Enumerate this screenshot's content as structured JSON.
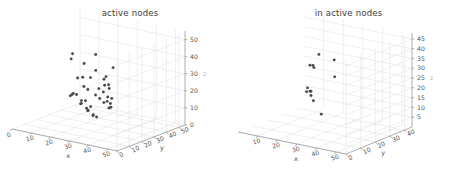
{
  "figure": {
    "background_color": "#ffffff",
    "point_color": "#4a4a4a",
    "grid_color": "#dcdcdc",
    "axis_color": "#8e8e8e"
  },
  "chart_data": [
    {
      "type": "scatter",
      "title": "active nodes",
      "xlabel": "x",
      "ylabel": "y",
      "zlabel": "z",
      "xlim": [
        0,
        55
      ],
      "ylim": [
        0,
        55
      ],
      "zlim": [
        0,
        55
      ],
      "xticks": [
        0,
        10,
        20,
        30,
        40,
        50
      ],
      "yticks": [
        0,
        10,
        20,
        30,
        40,
        50
      ],
      "zticks": [
        0,
        10,
        20,
        30,
        40,
        50
      ],
      "grid": true,
      "legend": "none",
      "points": [
        {
          "x": 38,
          "y": 9,
          "z": 50
        },
        {
          "x": 51,
          "y": 3,
          "z": 47
        },
        {
          "x": 22,
          "y": 15,
          "z": 45
        },
        {
          "x": 30,
          "y": 12,
          "z": 42
        },
        {
          "x": 40,
          "y": 6,
          "z": 42
        },
        {
          "x": 46,
          "y": 5,
          "z": 40
        },
        {
          "x": 20,
          "y": 17,
          "z": 41
        },
        {
          "x": 43,
          "y": 8,
          "z": 37
        },
        {
          "x": 48,
          "y": 4,
          "z": 36
        },
        {
          "x": 34,
          "y": 11,
          "z": 35
        },
        {
          "x": 44,
          "y": 7,
          "z": 34
        },
        {
          "x": 47,
          "y": 6,
          "z": 33
        },
        {
          "x": 28,
          "y": 14,
          "z": 33
        },
        {
          "x": 24,
          "y": 16,
          "z": 31
        },
        {
          "x": 39,
          "y": 10,
          "z": 30
        },
        {
          "x": 42,
          "y": 9,
          "z": 29
        },
        {
          "x": 49,
          "y": 5,
          "z": 28
        },
        {
          "x": 45,
          "y": 8,
          "z": 27
        },
        {
          "x": 26,
          "y": 18,
          "z": 26
        },
        {
          "x": 30,
          "y": 15,
          "z": 26
        },
        {
          "x": 36,
          "y": 12,
          "z": 25
        },
        {
          "x": 44,
          "y": 9,
          "z": 24
        },
        {
          "x": 47,
          "y": 7,
          "z": 24
        },
        {
          "x": 41,
          "y": 11,
          "z": 22
        },
        {
          "x": 46,
          "y": 9,
          "z": 21
        },
        {
          "x": 33,
          "y": 20,
          "z": 20
        },
        {
          "x": 43,
          "y": 12,
          "z": 19
        },
        {
          "x": 17,
          "y": 26,
          "z": 17
        },
        {
          "x": 12,
          "y": 31,
          "z": 15
        },
        {
          "x": 21,
          "y": 27,
          "z": 14
        },
        {
          "x": 8,
          "y": 36,
          "z": 12
        },
        {
          "x": 15,
          "y": 33,
          "z": 11
        },
        {
          "x": 25,
          "y": 25,
          "z": 12
        },
        {
          "x": 4,
          "y": 41,
          "z": 9
        },
        {
          "x": 13,
          "y": 36,
          "z": 8
        },
        {
          "x": 19,
          "y": 31,
          "z": 8
        },
        {
          "x": 10,
          "y": 40,
          "z": 6
        },
        {
          "x": 17,
          "y": 35,
          "z": 5
        },
        {
          "x": 23,
          "y": 30,
          "z": 5
        },
        {
          "x": 14,
          "y": 40,
          "z": 3
        },
        {
          "x": 18,
          "y": 38,
          "z": 2
        },
        {
          "x": 21,
          "y": 36,
          "z": 2
        }
      ]
    },
    {
      "type": "scatter",
      "title": "in active nodes",
      "xlabel": "x",
      "ylabel": "y",
      "zlabel": "z",
      "xlim": [
        0,
        55
      ],
      "ylim": [
        0,
        45
      ],
      "zlim": [
        0,
        48
      ],
      "xticks": [
        10,
        20,
        30,
        40,
        50
      ],
      "yticks": [
        0,
        10,
        20,
        30,
        40
      ],
      "zticks": [
        5,
        10,
        15,
        20,
        25,
        30,
        35,
        40,
        45
      ],
      "grid": true,
      "legend": "none",
      "points": [
        {
          "x": 46,
          "y": 4,
          "z": 45
        },
        {
          "x": 33,
          "y": 11,
          "z": 43
        },
        {
          "x": 44,
          "y": 7,
          "z": 35
        },
        {
          "x": 26,
          "y": 17,
          "z": 33
        },
        {
          "x": 24,
          "y": 19,
          "z": 33
        },
        {
          "x": 21,
          "y": 21,
          "z": 32
        },
        {
          "x": 13,
          "y": 30,
          "z": 16
        },
        {
          "x": 15,
          "y": 29,
          "z": 15
        },
        {
          "x": 17,
          "y": 27,
          "z": 16
        },
        {
          "x": 11,
          "y": 32,
          "z": 13
        },
        {
          "x": 14,
          "y": 31,
          "z": 12
        },
        {
          "x": 16,
          "y": 30,
          "z": 10
        },
        {
          "x": 20,
          "y": 30,
          "z": 4
        }
      ]
    }
  ]
}
